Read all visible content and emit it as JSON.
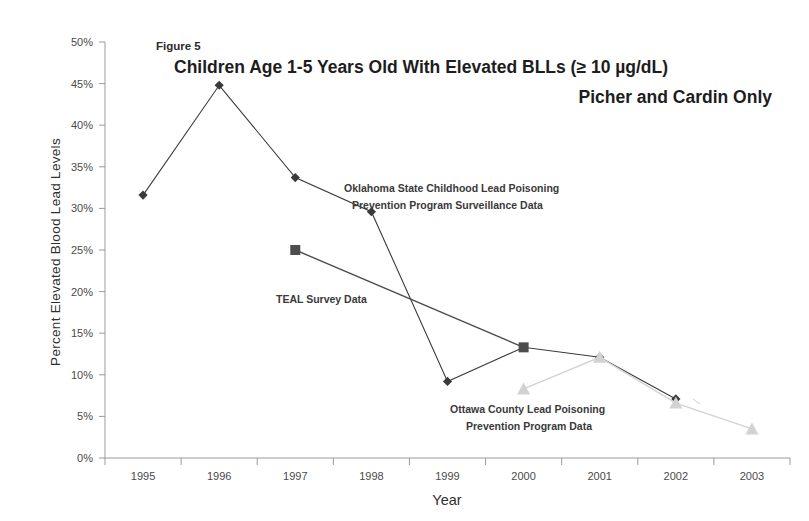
{
  "figure": {
    "number_label": "Figure 5",
    "title": "Children Age 1-5 Years Old With Elevated BLLs (≥ 10 µg/dL)",
    "subtitle": "Picher and Cardin Only"
  },
  "annotations": {
    "oklahoma_line1": "Oklahoma State Childhood Lead Poisoning",
    "oklahoma_line2": "Prevention Program Surveillance Data",
    "teal": "TEAL Survey Data",
    "ottawa_line1": "Ottawa County Lead Poisoning",
    "ottawa_line2": "Prevention Program Data"
  },
  "axes": {
    "x_title": "Year",
    "y_title": "Percent Elevated Blood Lead Levels",
    "x_ticks": [
      "1995",
      "1996",
      "1997",
      "1998",
      "1999",
      "2000",
      "2001",
      "2002",
      "2003"
    ],
    "y_ticks": [
      "0%",
      "5%",
      "10%",
      "15%",
      "20%",
      "25%",
      "30%",
      "35%",
      "40%",
      "45%",
      "50%"
    ]
  },
  "colors": {
    "series_oklahoma": "#3a3a3a",
    "series_teal": "#4d4d4d",
    "series_ottawa": "#d2d2d2",
    "axis": "#9b9b9b",
    "text": "#2f2f2f",
    "background": "#ffffff"
  },
  "chart_data": {
    "type": "line",
    "title": "Children Age 1-5 Years Old With Elevated BLLs (≥ 10 µg/dL)",
    "subtitle": "Picher and Cardin Only",
    "xlabel": "Year",
    "ylabel": "Percent Elevated Blood Lead Levels",
    "x": [
      1995,
      1996,
      1997,
      1998,
      1999,
      2000,
      2001,
      2002,
      2003
    ],
    "xlim": [
      1994.5,
      2003.5
    ],
    "ylim": [
      0,
      50
    ],
    "ytick_step": 5,
    "y_unit": "percent",
    "grid": false,
    "legend": "none (series labeled by in-plot annotations)",
    "series": [
      {
        "name": "Oklahoma State Childhood Lead Poisoning Prevention Program Surveillance Data",
        "marker": "diamond",
        "color": "#3a3a3a",
        "x": [
          1995,
          1996,
          1997,
          1998,
          1999,
          2000,
          2001,
          2002
        ],
        "values": [
          31.6,
          44.8,
          33.7,
          29.6,
          9.2,
          13.3,
          12.1,
          7.1
        ]
      },
      {
        "name": "TEAL Survey Data",
        "marker": "square",
        "color": "#4d4d4d",
        "x": [
          1997,
          2000
        ],
        "values": [
          25.0,
          13.3
        ]
      },
      {
        "name": "Ottawa County Lead Poisoning Prevention Program Data",
        "marker": "triangle",
        "color": "#d2d2d2",
        "x": [
          2000,
          2001,
          2002,
          2003
        ],
        "values": [
          8.3,
          12.1,
          6.6,
          3.5
        ]
      }
    ]
  }
}
